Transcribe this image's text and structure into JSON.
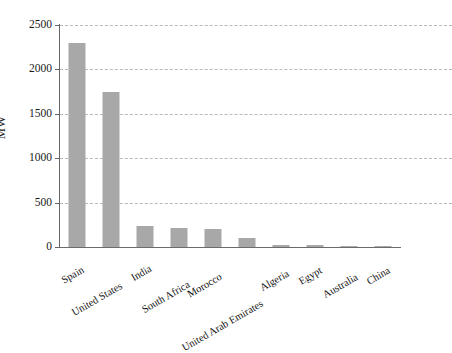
{
  "chart_data": {
    "type": "bar",
    "title": "",
    "subtitle": "",
    "xlabel": "",
    "ylabel": "MW",
    "ylim": [
      0,
      2500
    ],
    "yticks": [
      0,
      500,
      1000,
      1500,
      2000,
      2500
    ],
    "ytick_labels": [
      "0",
      "500",
      "1000",
      "1500",
      "2000",
      "2500"
    ],
    "grid": "horizontal-dashed",
    "legend": "none",
    "bar_color": "#a8a8a8",
    "categories": [
      "Spain",
      "United States",
      "India",
      "South Africa",
      "Morocco",
      "United Arab Emirates",
      "Algeria",
      "Egypt",
      "Australia",
      "China"
    ],
    "values": [
      2300,
      1750,
      240,
      210,
      200,
      100,
      25,
      20,
      5,
      3
    ],
    "series": [
      {
        "name": "Installed capacity",
        "values": [
          2300,
          1750,
          240,
          210,
          200,
          100,
          25,
          20,
          5,
          3
        ]
      }
    ]
  },
  "colors": {
    "bar": "#a8a8a8",
    "axis": "#666666",
    "grid": "#b9b9b9",
    "text": "#1a1a1a",
    "background": "#ffffff"
  }
}
